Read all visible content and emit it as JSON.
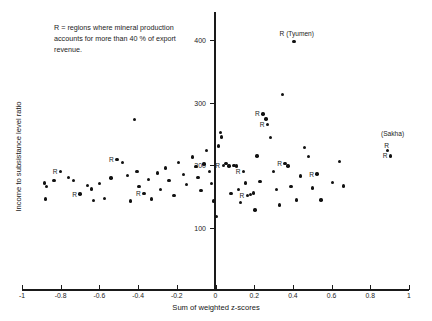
{
  "chart_data": {
    "type": "scatter",
    "title": "",
    "xlabel": "Sum of weighted z-scores",
    "ylabel": "Income to subsistance level ratio",
    "xlim": [
      -1,
      1
    ],
    "ylim": [
      60,
      430
    ],
    "grid": false,
    "legend": null,
    "annotation": "R = regions where mineral production\naccounts for more than 40 % of export\nrevenue.",
    "xticks": [
      -1,
      -0.8,
      -0.6,
      -0.4,
      -0.2,
      0,
      0.2,
      0.4,
      0.6,
      0.8,
      1
    ],
    "xtick_labels": [
      "-1",
      "-0.8",
      "-0.6",
      "-0.4",
      "-0.2",
      "0",
      "0.2",
      "0.4",
      "0.6",
      "0.8",
      "1"
    ],
    "yticks": [
      100,
      200,
      300,
      400
    ],
    "ytick_labels": [
      "100",
      "200",
      "300",
      "400"
    ],
    "marker_color": "#111111",
    "axis_color": "#1a1a1a",
    "points": [
      {
        "x": -0.885,
        "y": 172,
        "label": ""
      },
      {
        "x": -0.875,
        "y": 166,
        "label": ""
      },
      {
        "x": -0.88,
        "y": 146,
        "label": ""
      },
      {
        "x": -0.835,
        "y": 176,
        "label": ""
      },
      {
        "x": -0.8,
        "y": 190,
        "label": "R"
      },
      {
        "x": -0.76,
        "y": 181,
        "label": ""
      },
      {
        "x": -0.735,
        "y": 176,
        "label": ""
      },
      {
        "x": -0.7,
        "y": 154,
        "label": "R"
      },
      {
        "x": -0.66,
        "y": 168,
        "label": ""
      },
      {
        "x": -0.64,
        "y": 162,
        "label": ""
      },
      {
        "x": -0.63,
        "y": 144,
        "label": ""
      },
      {
        "x": -0.6,
        "y": 171,
        "label": ""
      },
      {
        "x": -0.575,
        "y": 147,
        "label": ""
      },
      {
        "x": -0.54,
        "y": 180,
        "label": ""
      },
      {
        "x": -0.51,
        "y": 209,
        "label": "R"
      },
      {
        "x": -0.48,
        "y": 205,
        "label": ""
      },
      {
        "x": -0.455,
        "y": 184,
        "label": ""
      },
      {
        "x": -0.44,
        "y": 143,
        "label": ""
      },
      {
        "x": -0.42,
        "y": 273,
        "label": ""
      },
      {
        "x": -0.405,
        "y": 190,
        "label": ""
      },
      {
        "x": -0.395,
        "y": 166,
        "label": ""
      },
      {
        "x": -0.37,
        "y": 155,
        "label": "R"
      },
      {
        "x": -0.345,
        "y": 177,
        "label": ""
      },
      {
        "x": -0.33,
        "y": 146,
        "label": ""
      },
      {
        "x": -0.3,
        "y": 188,
        "label": ""
      },
      {
        "x": -0.285,
        "y": 161,
        "label": ""
      },
      {
        "x": -0.26,
        "y": 196,
        "label": ""
      },
      {
        "x": -0.24,
        "y": 176,
        "label": ""
      },
      {
        "x": -0.215,
        "y": 152,
        "label": ""
      },
      {
        "x": -0.19,
        "y": 205,
        "label": ""
      },
      {
        "x": -0.165,
        "y": 185,
        "label": ""
      },
      {
        "x": -0.15,
        "y": 169,
        "label": ""
      },
      {
        "x": -0.12,
        "y": 213,
        "label": ""
      },
      {
        "x": -0.1,
        "y": 198,
        "label": ""
      },
      {
        "x": -0.09,
        "y": 181,
        "label": ""
      },
      {
        "x": -0.075,
        "y": 160,
        "label": ""
      },
      {
        "x": -0.06,
        "y": 202,
        "label": ""
      },
      {
        "x": -0.045,
        "y": 224,
        "label": ""
      },
      {
        "x": -0.03,
        "y": 190,
        "label": ""
      },
      {
        "x": -0.02,
        "y": 171,
        "label": ""
      },
      {
        "x": -0.01,
        "y": 143,
        "label": ""
      },
      {
        "x": 0.005,
        "y": 118,
        "label": ""
      },
      {
        "x": 0.015,
        "y": 231,
        "label": ""
      },
      {
        "x": 0.025,
        "y": 252,
        "label": ""
      },
      {
        "x": 0.03,
        "y": 245,
        "label": ""
      },
      {
        "x": 0.04,
        "y": 200,
        "label": "R"
      },
      {
        "x": 0.055,
        "y": 203,
        "label": ""
      },
      {
        "x": 0.07,
        "y": 199,
        "label": ""
      },
      {
        "x": 0.08,
        "y": 155,
        "label": ""
      },
      {
        "x": 0.095,
        "y": 200,
        "label": ""
      },
      {
        "x": 0.11,
        "y": 199,
        "label": ""
      },
      {
        "x": 0.12,
        "y": 161,
        "label": ""
      },
      {
        "x": 0.13,
        "y": 141,
        "label": ""
      },
      {
        "x": 0.145,
        "y": 190,
        "label": "R"
      },
      {
        "x": 0.155,
        "y": 172,
        "label": ""
      },
      {
        "x": 0.165,
        "y": 152,
        "label": "R"
      },
      {
        "x": 0.18,
        "y": 153,
        "label": ""
      },
      {
        "x": 0.195,
        "y": 156,
        "label": ""
      },
      {
        "x": 0.205,
        "y": 129,
        "label": ""
      },
      {
        "x": 0.215,
        "y": 215,
        "label": ""
      },
      {
        "x": 0.23,
        "y": 174,
        "label": ""
      },
      {
        "x": 0.245,
        "y": 282,
        "label": "R"
      },
      {
        "x": 0.26,
        "y": 274,
        "label": ""
      },
      {
        "x": 0.27,
        "y": 265,
        "label": "R"
      },
      {
        "x": 0.285,
        "y": 244,
        "label": ""
      },
      {
        "x": 0.3,
        "y": 190,
        "label": ""
      },
      {
        "x": 0.315,
        "y": 161,
        "label": ""
      },
      {
        "x": 0.33,
        "y": 137,
        "label": ""
      },
      {
        "x": 0.345,
        "y": 313,
        "label": ""
      },
      {
        "x": 0.36,
        "y": 203,
        "label": "R"
      },
      {
        "x": 0.375,
        "y": 199,
        "label": ""
      },
      {
        "x": 0.39,
        "y": 166,
        "label": ""
      },
      {
        "x": 0.405,
        "y": 398,
        "label": "R  (Tyumen)"
      },
      {
        "x": 0.42,
        "y": 145,
        "label": ""
      },
      {
        "x": 0.44,
        "y": 183,
        "label": ""
      },
      {
        "x": 0.46,
        "y": 228,
        "label": ""
      },
      {
        "x": 0.48,
        "y": 214,
        "label": ""
      },
      {
        "x": 0.5,
        "y": 164,
        "label": ""
      },
      {
        "x": 0.525,
        "y": 186,
        "label": "R"
      },
      {
        "x": 0.545,
        "y": 145,
        "label": ""
      },
      {
        "x": 0.605,
        "y": 173,
        "label": ""
      },
      {
        "x": 0.64,
        "y": 206,
        "label": ""
      },
      {
        "x": 0.66,
        "y": 167,
        "label": ""
      },
      {
        "x": 0.89,
        "y": 224,
        "label": ""
      },
      {
        "x": 0.905,
        "y": 215,
        "label": "R"
      }
    ],
    "callouts": [
      {
        "text": "R  (Tyumen)",
        "x": 0.42,
        "y": 411
      },
      {
        "text": "(Sakha)",
        "x": 0.915,
        "y": 252
      },
      {
        "text": "R",
        "x": 0.885,
        "y": 233
      }
    ]
  }
}
